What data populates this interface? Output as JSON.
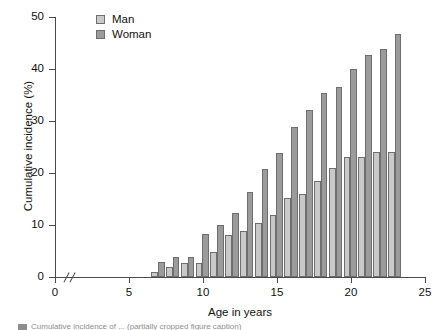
{
  "chart_data": {
    "type": "bar",
    "title": "",
    "xlabel": "Age in years",
    "ylabel": "Cumulative incidence (%)",
    "xlim": [
      0,
      25
    ],
    "ylim": [
      0,
      50
    ],
    "xticks": [
      0,
      5,
      10,
      15,
      20,
      25
    ],
    "yticks": [
      0,
      10,
      20,
      30,
      40,
      50
    ],
    "grid": false,
    "axis_break": "x-axis broken between 0 and 5",
    "legend_position": "top-left inside plot",
    "categories": [
      7,
      8,
      9,
      10,
      11,
      12,
      13,
      14,
      15,
      16,
      17,
      18,
      19,
      20,
      21,
      22,
      23
    ],
    "series": [
      {
        "name": "Man",
        "color": "#c9c9c9",
        "values": [
          1.0,
          2.0,
          2.7,
          2.7,
          4.8,
          8.0,
          8.9,
          10.4,
          12.0,
          15.1,
          15.9,
          18.4,
          20.9,
          23.0,
          23.0,
          24.0,
          24.0
        ]
      },
      {
        "name": "Woman",
        "color": "#9b9b9b",
        "values": [
          2.8,
          3.9,
          3.9,
          8.3,
          10.0,
          12.3,
          16.3,
          20.7,
          23.8,
          28.9,
          32.1,
          35.3,
          36.5,
          40.0,
          42.7,
          43.8,
          46.8
        ]
      }
    ]
  },
  "legend": {
    "items": [
      {
        "label": "Man",
        "key": "man"
      },
      {
        "label": "Woman",
        "key": "woman"
      }
    ]
  },
  "caption": {
    "text": "Cumulative incidence of ... (partially cropped figure caption)"
  }
}
